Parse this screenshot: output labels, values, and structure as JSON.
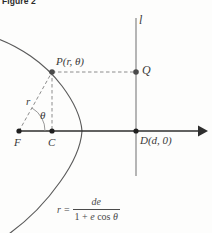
{
  "figure": {
    "caption": "Figure 2",
    "type": "conic-section-polar-diagram"
  },
  "labels": {
    "point_P": "P(r, θ)",
    "point_Q": "Q",
    "point_F": "F",
    "point_C": "C",
    "point_D": "D(d, 0)",
    "directrix_line": "l",
    "radius": "r",
    "angle": "θ"
  },
  "formula": {
    "lhs": "r",
    "equals": "=",
    "numerator": "de",
    "denominator_one": "1",
    "denominator_plus": "+",
    "denominator_e": "e",
    "denominator_cos": "cos",
    "denominator_theta": "θ"
  },
  "colors": {
    "curve": "#5a5a5a",
    "axis": "#2e2e2e",
    "dashed": "#8c8c8c",
    "directrix": "#7a7a7a",
    "text": "#3a3a3a",
    "background": "#fdfdfc"
  },
  "geometry": {
    "focus_F": [
      19,
      131
    ],
    "center_C": [
      52,
      131
    ],
    "point_P": [
      52,
      72
    ],
    "point_Q": [
      136,
      72
    ],
    "point_D": [
      136,
      131
    ],
    "curve_vertex_x": 82,
    "directrix_x": 136,
    "axis_y": 131,
    "axis_arrow_x": 205
  }
}
